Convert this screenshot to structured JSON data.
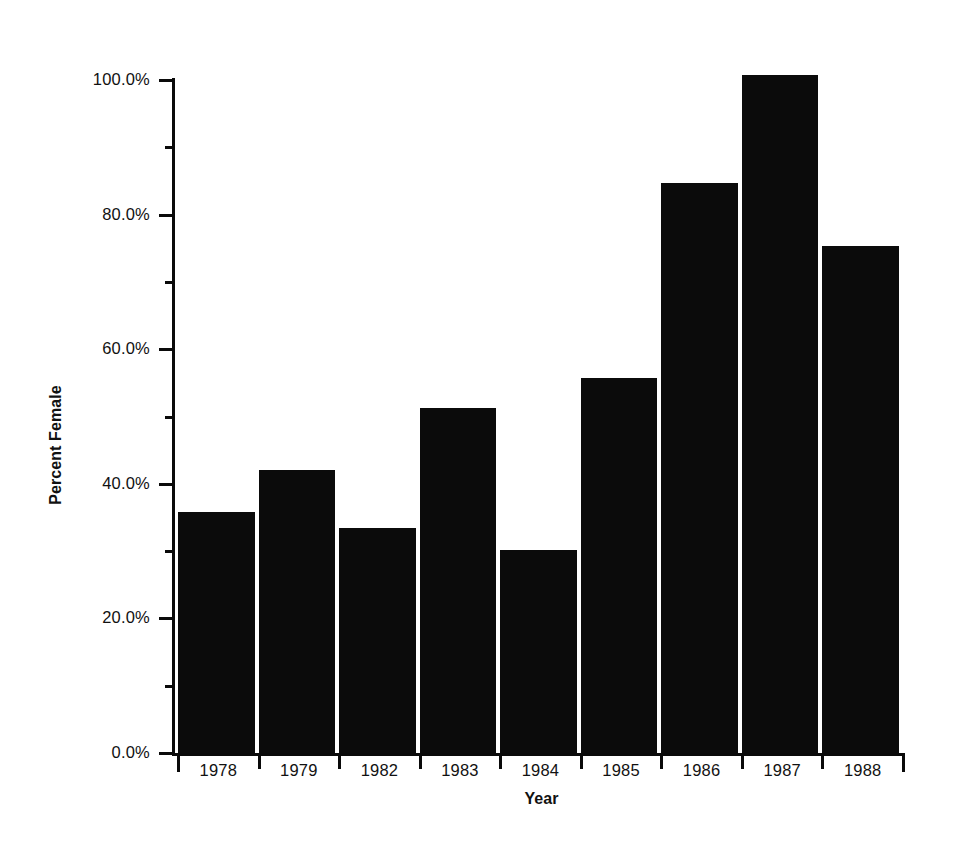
{
  "chart_data": {
    "type": "bar",
    "title": "",
    "subtitle": "",
    "xlabel": "Year",
    "ylabel": "Percent Female",
    "categories": [
      "1978",
      "1979",
      "1982",
      "1983",
      "1984",
      "1985",
      "1986",
      "1987",
      "1988"
    ],
    "values": [
      35.8,
      42.1,
      33.4,
      51.3,
      30.2,
      55.7,
      84.7,
      100.8,
      75.3
    ],
    "value_labels": [
      "",
      "",
      "",
      "",
      "",
      "",
      "",
      "",
      ""
    ],
    "ylim": [
      0.0,
      101.0
    ],
    "y_major_ticks": [
      0.0,
      20.0,
      40.0,
      60.0,
      80.0,
      100.0
    ],
    "y_major_tick_labels": [
      "0.0%",
      "20.0%",
      "40.0%",
      "60.0%",
      "80.0%",
      "100.0%"
    ],
    "y_minor_ticks": [
      10.0,
      30.0,
      50.0,
      70.0,
      90.0
    ],
    "grid": false,
    "legend": false,
    "legend_position": "none",
    "bar_color": "#0b0b0b",
    "axis_color": "#0a0a0a",
    "background_color": "#ffffff",
    "annotations": []
  },
  "axes": {
    "y_title": "Percent Female",
    "x_title": "Year"
  },
  "colors": {
    "bar": "#0b0b0b",
    "axis": "#0a0a0a",
    "text": "#111111",
    "background": "#ffffff"
  }
}
